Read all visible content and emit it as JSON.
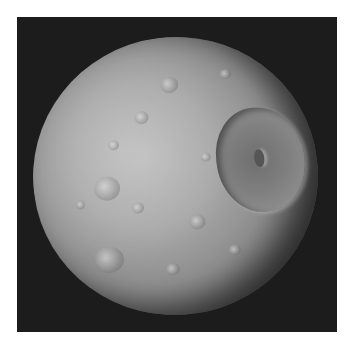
{
  "image": {
    "subject": "cratered moon",
    "background_color": "#1c1c1c",
    "page_background": "#ffffff"
  }
}
